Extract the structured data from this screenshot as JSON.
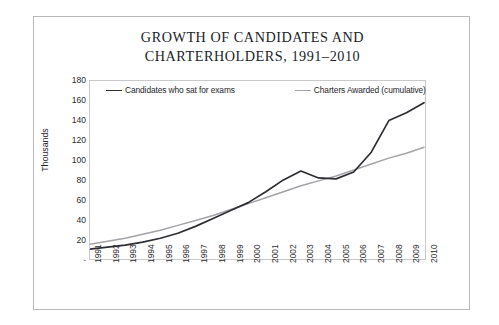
{
  "figure": {
    "title_line1": "GROWTH OF CANDIDATES AND",
    "title_line2": "CHARTERHOLDERS, 1991–2010",
    "frame_color": "#b9b9b9",
    "background": "#ffffff"
  },
  "chart_data": {
    "type": "line",
    "title": "GROWTH OF CANDIDATES AND CHARTERHOLDERS, 1991–2010",
    "xlabel": "",
    "ylabel": "Thousands",
    "categories": [
      "1991",
      "1992",
      "1993",
      "1994",
      "1995",
      "1996",
      "1997",
      "1998",
      "1999",
      "2000",
      "2001",
      "2002",
      "2003",
      "2004",
      "2005",
      "2006",
      "2007",
      "2008",
      "2009",
      "2010"
    ],
    "xtick_labels": [
      "1991",
      "1992",
      "1993",
      "1994",
      "1995",
      "1996",
      "1997",
      "1998",
      "1999",
      "2000",
      "2001",
      "2002",
      "2003",
      "2004",
      "2005",
      "2006",
      "2007",
      "2008",
      "2009",
      "2010"
    ],
    "ytick_labels": [
      "-",
      "20",
      "40",
      "60",
      "80",
      "100",
      "120",
      "140",
      "160",
      "180"
    ],
    "ytick_values": [
      0,
      20,
      40,
      60,
      80,
      100,
      120,
      140,
      160,
      180
    ],
    "ylim": [
      0,
      180
    ],
    "grid": false,
    "legend_position": "top-inside",
    "series": [
      {
        "name": "Candidates who sat for exams",
        "color": "#2d2d33",
        "values": [
          10,
          12,
          14,
          17,
          21,
          26,
          33,
          41,
          49,
          57,
          68,
          80,
          89,
          82,
          81,
          88,
          108,
          140,
          148,
          158
        ]
      },
      {
        "name": "Charters Awarded (cumulative)",
        "color": "#a3a3a8",
        "values": [
          15,
          18,
          21,
          25,
          29,
          34,
          39,
          44,
          50,
          56,
          62,
          68,
          74,
          79,
          84,
          90,
          96,
          102,
          107,
          113
        ]
      }
    ]
  }
}
